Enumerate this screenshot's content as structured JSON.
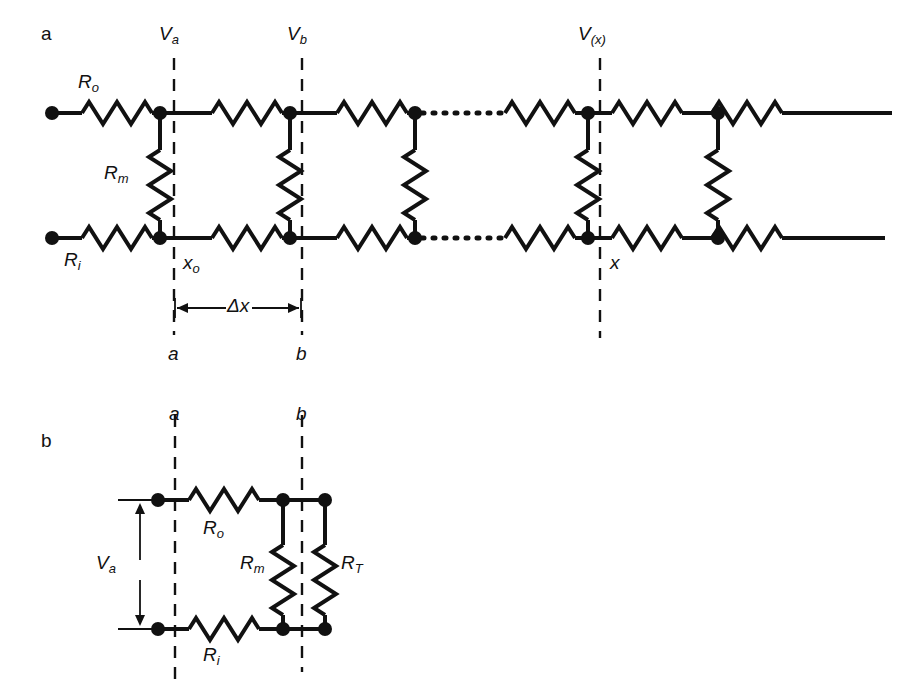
{
  "figure": {
    "type": "circuit-diagram",
    "panels": [
      {
        "id": "a",
        "label": "a",
        "description": "Ladder network of extracellular resistance Ro, membrane resistance Rm and axial (internal) resistance Ri, with voltage nodes Va, Vb and V(x)",
        "labels": {
          "r_outer": "R",
          "r_outer_sub": "o",
          "r_membrane": "R",
          "r_membrane_sub": "m",
          "r_internal": "R",
          "r_internal_sub": "i",
          "v_a": "V",
          "v_a_sub": "a",
          "v_b": "V",
          "v_b_sub": "b",
          "v_x": "V",
          "v_x_sub": "(x)",
          "x_o": "x",
          "x_o_sub": "o",
          "x": "x",
          "delta_x": "Δx",
          "cut_a": "a",
          "cut_b": "b"
        }
      },
      {
        "id": "b",
        "label": "b",
        "description": "Reduced single-segment circuit between cuts a and b showing Ro, Ri, Rm and terminating resistance RT across voltage Va",
        "labels": {
          "r_outer": "R",
          "r_outer_sub": "o",
          "r_internal": "R",
          "r_internal_sub": "i",
          "r_membrane": "R",
          "r_membrane_sub": "m",
          "r_terminal": "R",
          "r_terminal_sub": "T",
          "v_a": "V",
          "v_a_sub": "a",
          "cut_a": "a",
          "cut_b": "b"
        }
      }
    ],
    "style": {
      "stroke": "#111111",
      "background": "#ffffff",
      "wire_width": 4,
      "dash_width": 2
    }
  }
}
